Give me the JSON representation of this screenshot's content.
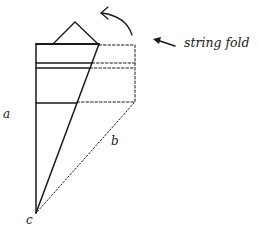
{
  "diagram": {
    "annotation": "string fold",
    "labels": {
      "a": "a",
      "b": "b",
      "c": "c"
    },
    "colors": {
      "stroke": "#1a1a1a",
      "background": "#ffffff"
    }
  }
}
